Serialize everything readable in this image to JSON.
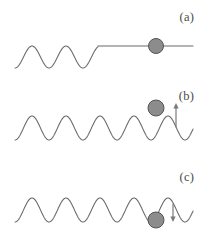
{
  "figure": {
    "type": "physics-schematic",
    "background_color": "#ffffff",
    "stroke_color": "#6b6b6b",
    "ball_fill_color": "#8c8c8c",
    "ball_stroke_color": "#555555",
    "arrow_color": "#7a7a7a",
    "label_color": "#4a4a4a",
    "line_width": 1.1
  },
  "panels": [
    {
      "id": "a",
      "label": "(a)",
      "description": "oscillating-then-flat landscape with ball resting on flat segment",
      "wave": {
        "baseline_y": 57,
        "amplitude": 11,
        "wavelength": 34,
        "start_x": 15,
        "oscillation_end_x": 98,
        "flat_y": 46,
        "flat_end_x": 193,
        "crest_count": 2
      },
      "ball": {
        "cx": 156,
        "cy": 46,
        "r": 7.5,
        "on": "flat-line"
      },
      "arrow": null
    },
    {
      "id": "b",
      "label": "(b)",
      "description": "continuous wave with ball balanced on a crest and upward arrow",
      "wave": {
        "baseline_y": 46,
        "amplitude": 12,
        "wavelength": 34,
        "start_x": 15,
        "end_x": 193,
        "crest_count": 4
      },
      "ball": {
        "cx": 156,
        "cy": 26,
        "r": 8,
        "on": "crest"
      },
      "arrow": {
        "direction": "up",
        "x": 176,
        "y_top": 21,
        "y_bottom": 45,
        "length": 24
      }
    },
    {
      "id": "c",
      "label": "(c)",
      "description": "continuous wave with ball settled in a trough and downward arrow",
      "wave": {
        "baseline_y": 46,
        "amplitude": 12,
        "wavelength": 34,
        "start_x": 15,
        "end_x": 193,
        "crest_count": 4
      },
      "ball": {
        "cx": 156,
        "cy": 56,
        "r": 8,
        "on": "trough"
      },
      "arrow": {
        "direction": "down",
        "x": 173,
        "y_top": 40,
        "y_bottom": 58,
        "length": 18
      }
    }
  ]
}
